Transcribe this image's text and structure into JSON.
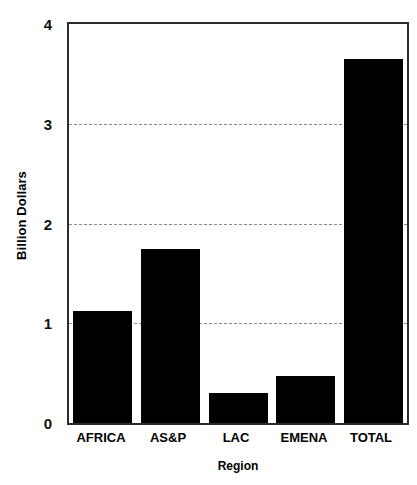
{
  "chart_data": {
    "type": "bar",
    "title": "",
    "xlabel": "Region",
    "ylabel": "Billion Dollars",
    "categories": [
      "AFRICA",
      "AS&P",
      "LAC",
      "EMENA",
      "TOTAL"
    ],
    "values": [
      1.12,
      1.74,
      0.3,
      0.47,
      3.65
    ],
    "series": [
      {
        "name": "Billion Dollars",
        "values": [
          1.12,
          1.74,
          0.3,
          0.47,
          3.65
        ]
      }
    ],
    "ylim": [
      0,
      4
    ],
    "ytick_labels": [
      "0",
      "1",
      "2",
      "3",
      "4"
    ],
    "ytick_values": [
      0,
      1,
      2,
      3,
      4
    ],
    "gridlines": [
      1,
      2,
      3
    ],
    "grid": true,
    "grid_style": "dashed",
    "legend": "none",
    "bar_color": "#000000",
    "axis_color": "#2b2b2b",
    "grid_color": "#8a8a8a",
    "background": "#ffffff"
  },
  "axes": {
    "y_title": "Billion Dollars",
    "x_title": "Region"
  }
}
